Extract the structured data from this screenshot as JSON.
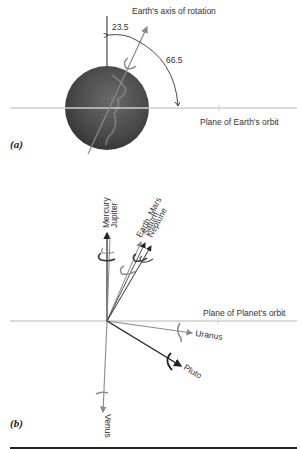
{
  "panel_a": {
    "label": "(a)",
    "axis_title": "Earth's axis of rotation",
    "angle_tilt": "23.5",
    "angle_complement": "66.5",
    "plane_label": "Plane of Earth's orbit"
  },
  "panel_b": {
    "label": "(b)",
    "plane_label": "Plane of Planet's orbit",
    "planets": [
      {
        "name": "Mercury",
        "group_label": "Mercury"
      },
      {
        "name": "Jupiter",
        "group_label": "Jupiter"
      },
      {
        "name": "Earth",
        "group_label": "Earth, Mars"
      },
      {
        "name": "Saturn",
        "group_label": "Saturn"
      },
      {
        "name": "Neptune",
        "group_label": "Neptune"
      },
      {
        "name": "Uranus",
        "group_label": "Uranus"
      },
      {
        "name": "Pluto",
        "group_label": "Pluto"
      },
      {
        "name": "Venus",
        "group_label": "Venus"
      }
    ]
  },
  "colors": {
    "axis_dark": "#222222",
    "axis_gray": "#8a8a8a",
    "plane_line": "#cfcfcf",
    "globe": "#4a4a4a"
  }
}
